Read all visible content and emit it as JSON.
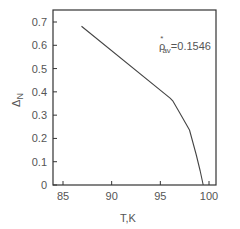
{
  "chart_data": {
    "type": "line",
    "title": "",
    "xlabel": "T,K",
    "ylabel_main": "Δ",
    "ylabel_sub": "N",
    "xlim": [
      83.5,
      102.2
    ],
    "ylim": [
      0,
      0.75
    ],
    "xticks": [
      85,
      90,
      95,
      100
    ],
    "xtick_labels": [
      "85",
      "90",
      "95",
      "100"
    ],
    "yticks": [
      0,
      0.1,
      0.2,
      0.3,
      0.4,
      0.5,
      0.6,
      0.7
    ],
    "ytick_labels": [
      "0",
      "0.1",
      "0.2",
      "0.3",
      "0.4",
      "0.5",
      "0.6",
      "0.7"
    ],
    "grid": false,
    "legend": null,
    "annotation": {
      "symbol": "ρ",
      "superscript": "*",
      "subscript": "av",
      "text": "=0.1546",
      "placement": "top-right"
    },
    "series": [
      {
        "name": "Δ_N(T)",
        "color": "#444444",
        "x": [
          86.9,
          96.0,
          96.3,
          97.0,
          98.0,
          98.7,
          99.1,
          99.4
        ],
        "y": [
          0.682,
          0.373,
          0.36,
          0.309,
          0.236,
          0.129,
          0.06,
          0.0
        ]
      }
    ]
  }
}
